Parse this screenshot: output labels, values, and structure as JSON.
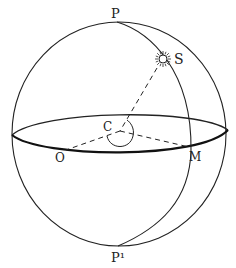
{
  "diagram": {
    "type": "celestial-sphere",
    "labels": {
      "north_pole": "P",
      "south_pole": "P¹",
      "star": "S",
      "center": "C",
      "observer_point": "O",
      "meridian_point": "M"
    },
    "colors": {
      "stroke": "#222222",
      "background": "#ffffff"
    }
  }
}
